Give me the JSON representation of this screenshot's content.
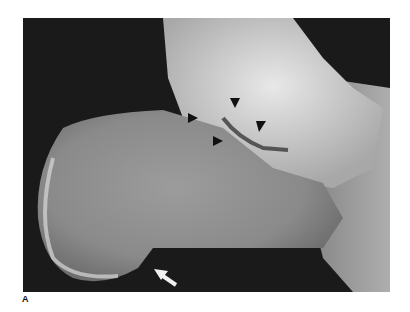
{
  "figure": {
    "panel_label": "A",
    "content": "lateral radiograph of calcaneus (heel bone)",
    "annotations": [
      {
        "type": "black-arrow",
        "count": 4,
        "location": "subtalar joint region",
        "color": "#111111"
      },
      {
        "type": "white-arrow",
        "count": 1,
        "location": "plantar heel",
        "color": "#f0f0f0"
      }
    ],
    "colors": {
      "background": "#1a1a1a",
      "bone": "#b8b8b8",
      "bone_bright": "#e6e6e6",
      "page": "#ffffff"
    }
  }
}
